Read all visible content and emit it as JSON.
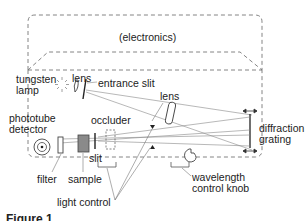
{
  "diagram": {
    "labels": {
      "electronics": "(electronics)",
      "tungsten_lamp_line1": "tungsten",
      "tungsten_lamp_line2": "lamp",
      "lens_1": "lens",
      "entrance_slit": "entrance slit",
      "lens_2": "lens",
      "phototube_line1": "phototube",
      "phototube_line2": "detector",
      "occluder": "occluder",
      "diffraction_line1": "diffraction",
      "diffraction_line2": "grating",
      "slit": "slit",
      "filter": "filter",
      "sample": "sample",
      "wavelength_line1": "wavelength",
      "wavelength_line2": "control knob",
      "light_control": "light control"
    },
    "caption": "Figure 1"
  },
  "colors": {
    "line": "#555555",
    "dashed": "#777777",
    "sample_fill": "#8a8a8a",
    "text": "#222222"
  }
}
